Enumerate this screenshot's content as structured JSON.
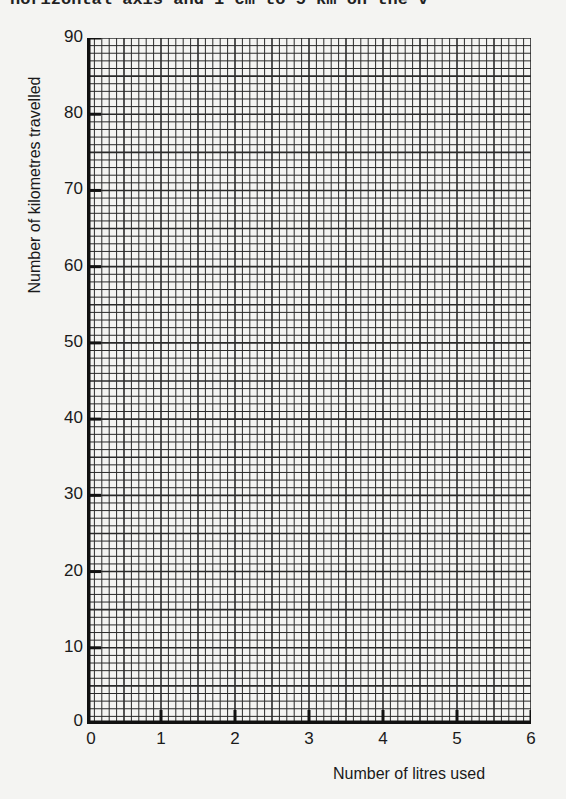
{
  "header": {
    "text": "horizontal axis and 1 cm to 5 km on the v"
  },
  "chart_data": {
    "type": "line",
    "title": "",
    "xlabel": "Number of litres used",
    "ylabel": "Number of kilometres travelled",
    "xlim": [
      0,
      6
    ],
    "ylim": [
      0,
      90
    ],
    "x_ticks": [
      "0",
      "1",
      "2",
      "3",
      "4",
      "5",
      "6"
    ],
    "y_ticks": [
      "0",
      "10",
      "20",
      "30",
      "40",
      "50",
      "60",
      "70",
      "80",
      "90"
    ],
    "grid": true,
    "grid_minor_x_per_unit": 10,
    "grid_minor_y_per_10": 10,
    "series": []
  },
  "colors": {
    "grid": "#2a2a2a",
    "axis": "#111111",
    "paper": "#f4f4f2"
  }
}
